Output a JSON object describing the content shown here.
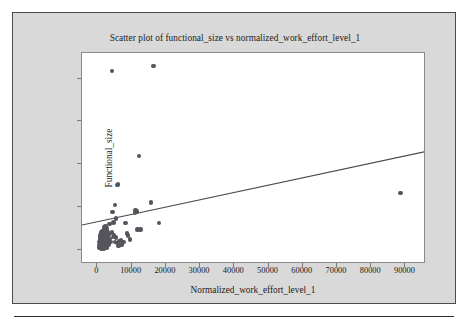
{
  "figure": {
    "title": "Scatter plot of functional_size vs normalized_work_effort_level_1",
    "background_color": "#d9d9d9",
    "plot_background_color": "#ffffff",
    "frame_color": "#4b4b4b",
    "marker_color": "#55555c",
    "line_color": "#4a4a4a"
  },
  "chart_data": {
    "type": "scatter",
    "title": "Scatter plot of functional_size vs normalized_work_effort_level_1",
    "xlabel": "Normalized_work_effort_level_1",
    "ylabel": "Functional_size",
    "xlim": [
      -4500,
      96000
    ],
    "ylim": [
      -330,
      4600
    ],
    "xticks": [
      0,
      10000,
      20000,
      30000,
      40000,
      50000,
      60000,
      70000,
      80000,
      90000
    ],
    "xticklabels": [
      "0",
      "10000",
      "20000",
      "30000",
      "40000",
      "50000",
      "60000",
      "70000",
      "80000",
      "90000"
    ],
    "yticks": [
      0,
      1000,
      2000,
      3000,
      4000
    ],
    "yticklabels": [
      "0",
      "1000",
      "2000",
      "3000",
      "4000"
    ],
    "grid": false,
    "legend": null,
    "marker_size": 4.4,
    "points": [
      [
        4200,
        4180
      ],
      [
        16400,
        4290
      ],
      [
        12200,
        2190
      ],
      [
        5700,
        1510
      ],
      [
        6000,
        1525
      ],
      [
        5100,
        1055
      ],
      [
        15600,
        1110
      ],
      [
        88600,
        1330
      ],
      [
        4400,
        880
      ],
      [
        5400,
        735
      ],
      [
        11100,
        920
      ],
      [
        11600,
        900
      ],
      [
        10900,
        860
      ],
      [
        8200,
        625
      ],
      [
        18000,
        630
      ],
      [
        11700,
        475
      ],
      [
        12600,
        480
      ],
      [
        8700,
        380
      ],
      [
        2400,
        545
      ],
      [
        2000,
        520
      ],
      [
        2700,
        500
      ],
      [
        1900,
        470
      ],
      [
        2300,
        455
      ],
      [
        1500,
        440
      ],
      [
        2600,
        430
      ],
      [
        3000,
        420
      ],
      [
        1200,
        410
      ],
      [
        1700,
        400
      ],
      [
        2100,
        390
      ],
      [
        2900,
        380
      ],
      [
        1400,
        370
      ],
      [
        2500,
        360
      ],
      [
        3300,
        355
      ],
      [
        900,
        345
      ],
      [
        1800,
        340
      ],
      [
        2200,
        330
      ],
      [
        1100,
        320
      ],
      [
        2800,
        315
      ],
      [
        1600,
        305
      ],
      [
        2000,
        295
      ],
      [
        700,
        290
      ],
      [
        2400,
        285
      ],
      [
        1300,
        275
      ],
      [
        3100,
        270
      ],
      [
        1900,
        260
      ],
      [
        950,
        250
      ],
      [
        2600,
        245
      ],
      [
        1500,
        240
      ],
      [
        2150,
        230
      ],
      [
        800,
        225
      ],
      [
        1700,
        215
      ],
      [
        2350,
        210
      ],
      [
        1250,
        200
      ],
      [
        2900,
        195
      ],
      [
        600,
        190
      ],
      [
        1850,
        180
      ],
      [
        2450,
        175
      ],
      [
        1050,
        165
      ],
      [
        3400,
        160
      ],
      [
        1600,
        155
      ],
      [
        2200,
        148
      ],
      [
        780,
        140
      ],
      [
        1400,
        132
      ],
      [
        2700,
        128
      ],
      [
        1900,
        120
      ],
      [
        1150,
        112
      ],
      [
        2450,
        105
      ],
      [
        1650,
        98
      ],
      [
        900,
        90
      ],
      [
        2050,
        82
      ],
      [
        1350,
        74
      ],
      [
        2600,
        68
      ],
      [
        1750,
        60
      ],
      [
        1050,
        52
      ],
      [
        2250,
        45
      ],
      [
        1500,
        38
      ],
      [
        500,
        60
      ],
      [
        650,
        120
      ],
      [
        1200,
        30
      ],
      [
        1950,
        25
      ],
      [
        2800,
        40
      ],
      [
        3600,
        260
      ],
      [
        4600,
        300
      ],
      [
        5200,
        190
      ],
      [
        5900,
        160
      ],
      [
        6500,
        210
      ],
      [
        7100,
        140
      ],
      [
        6900,
        235
      ],
      [
        7600,
        185
      ],
      [
        7000,
        115
      ],
      [
        6200,
        95
      ],
      [
        5500,
        290
      ],
      [
        4900,
        340
      ],
      [
        4200,
        410
      ],
      [
        3800,
        180
      ],
      [
        3200,
        130
      ],
      [
        8900,
        340
      ],
      [
        9600,
        240
      ],
      [
        4700,
        640
      ],
      [
        3500,
        600
      ]
    ],
    "trend_line": {
      "type": "linear-fit",
      "x_start": -4500,
      "y_start": 580,
      "x_end": 96000,
      "y_end": 2300
    }
  }
}
